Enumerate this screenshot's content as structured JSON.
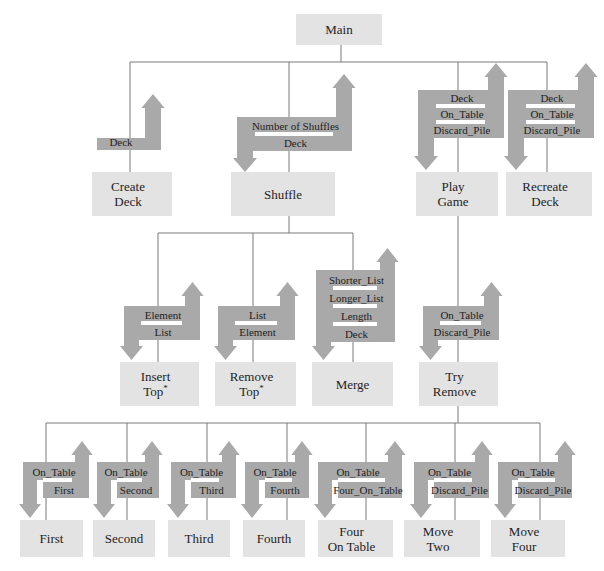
{
  "diagram": {
    "type": "structure-chart",
    "colors": {
      "box_fill": "#e3e3e3",
      "arrow_fill": "#a9a9a9",
      "line": "#7a7a7a",
      "text": "#1e1e1e"
    },
    "root": {
      "id": "main",
      "label": [
        "Main"
      ]
    },
    "nodes": [
      {
        "id": "create-deck",
        "label": [
          "Create",
          "Deck"
        ],
        "parent": "main",
        "params_in": [],
        "params_out": [
          "Deck"
        ]
      },
      {
        "id": "shuffle",
        "label": [
          "Shuffle"
        ],
        "parent": "main",
        "params_in": [
          "Number of Shuffles",
          "Deck"
        ],
        "params_out": [
          "Deck"
        ]
      },
      {
        "id": "play-game",
        "label": [
          "Play",
          "Game"
        ],
        "parent": "main",
        "params_in": [
          "Deck",
          "On_Table",
          "Discard_Pile"
        ],
        "params_out": [
          "Deck",
          "On_Table",
          "Discard_Pile"
        ]
      },
      {
        "id": "recreate-deck",
        "label": [
          "Recreate",
          "Deck"
        ],
        "parent": "main",
        "params_in": [
          "Deck",
          "On_Table",
          "Discard_Pile"
        ],
        "params_out": [
          "Deck",
          "On_Table",
          "Discard_Pile"
        ]
      },
      {
        "id": "insert-top",
        "label": [
          "Insert",
          "Top*"
        ],
        "parent": "shuffle",
        "params_in": [
          "Element",
          "List"
        ],
        "params_out": [
          "List"
        ]
      },
      {
        "id": "remove-top",
        "label": [
          "Remove",
          "Top*"
        ],
        "parent": "shuffle",
        "params_in": [
          "List"
        ],
        "params_out": [
          "List",
          "Element"
        ]
      },
      {
        "id": "merge",
        "label": [
          "Merge"
        ],
        "parent": "shuffle",
        "params_in": [
          "Shorter_List",
          "Longer_List",
          "Length",
          "Deck"
        ],
        "params_out": [
          "Deck"
        ]
      },
      {
        "id": "try-remove",
        "label": [
          "Try",
          "Remove"
        ],
        "parent": "play-game",
        "params_in": [
          "On_Table",
          "Discard_Pile"
        ],
        "params_out": [
          "On_Table",
          "Discard_Pile"
        ]
      },
      {
        "id": "first",
        "label": [
          "First"
        ],
        "parent": "try-remove",
        "params_in": [
          "On_Table"
        ],
        "params_out": [
          "First"
        ]
      },
      {
        "id": "second",
        "label": [
          "Second"
        ],
        "parent": "try-remove",
        "params_in": [
          "On_Table"
        ],
        "params_out": [
          "Second"
        ]
      },
      {
        "id": "third",
        "label": [
          "Third"
        ],
        "parent": "try-remove",
        "params_in": [
          "On_Table"
        ],
        "params_out": [
          "Third"
        ]
      },
      {
        "id": "fourth",
        "label": [
          "Fourth"
        ],
        "parent": "try-remove",
        "params_in": [
          "On_Table"
        ],
        "params_out": [
          "Fourth"
        ]
      },
      {
        "id": "four-on-table",
        "label": [
          "Four",
          "On Table"
        ],
        "parent": "try-remove",
        "params_in": [
          "On_Table"
        ],
        "params_out": [
          "Four_On_Table"
        ]
      },
      {
        "id": "move-two",
        "label": [
          "Move",
          "Two"
        ],
        "parent": "try-remove",
        "params_in": [
          "On_Table",
          "Discard_Pile"
        ],
        "params_out": [
          "On_Table",
          "Discard_Pile"
        ]
      },
      {
        "id": "move-four",
        "label": [
          "Move",
          "Four"
        ],
        "parent": "try-remove",
        "params_in": [
          "On_Table",
          "Discard_Pile"
        ],
        "params_out": [
          "On_Table",
          "Discard_Pile"
        ]
      }
    ],
    "arrow_labels": {
      "create-deck": [
        "Deck"
      ],
      "shuffle": [
        "Number of Shuffles",
        "Deck"
      ],
      "play-game": [
        "Deck",
        "On_Table",
        "Discard_Pile"
      ],
      "recreate-deck": [
        "Deck",
        "On_Table",
        "Discard_Pile"
      ],
      "insert-top": [
        "Element",
        "List"
      ],
      "remove-top": [
        "List",
        "Element"
      ],
      "merge": [
        "Shorter_List",
        "Longer_List",
        "Length",
        "Deck"
      ],
      "try-remove": [
        "On_Table",
        "Discard_Pile"
      ],
      "first": [
        "On_Table",
        "First"
      ],
      "second": [
        "On_Table",
        "Second"
      ],
      "third": [
        "On_Table",
        "Third"
      ],
      "fourth": [
        "On_Table",
        "Fourth"
      ],
      "four-on-table": [
        "On_Table",
        "Four_On_Table"
      ],
      "move-two": [
        "On_Table",
        "Discard_Pile"
      ],
      "move-four": [
        "On_Table",
        "Discard_Pile"
      ]
    }
  }
}
